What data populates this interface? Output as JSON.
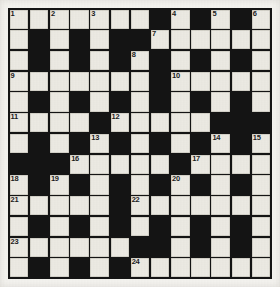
{
  "puzzle": {
    "title": "Crossword Grid",
    "type": "crossword",
    "columns": 13,
    "rows": 13,
    "colors": {
      "paper": "#f4f3ef",
      "white_cell": "#eceae3",
      "black_cell": "#141414",
      "number_text": "#1b1b1b"
    },
    "legend": {
      "white": "open letter square",
      "black": "blocked square"
    },
    "clue_numbers_present": [
      1,
      2,
      3,
      4,
      5,
      6,
      7,
      8,
      9,
      10,
      11,
      12,
      13,
      14,
      15,
      16,
      17,
      18,
      19,
      20,
      21,
      22,
      23,
      24
    ],
    "grid": [
      [
        {
          "state": "white",
          "num": "1"
        },
        {
          "state": "white",
          "num": ""
        },
        {
          "state": "white",
          "num": "2"
        },
        {
          "state": "white",
          "num": ""
        },
        {
          "state": "white",
          "num": "3"
        },
        {
          "state": "white",
          "num": ""
        },
        {
          "state": "white",
          "num": ""
        },
        {
          "state": "black",
          "num": ""
        },
        {
          "state": "white",
          "num": "4"
        },
        {
          "state": "black",
          "num": ""
        },
        {
          "state": "white",
          "num": "5"
        },
        {
          "state": "black",
          "num": ""
        },
        {
          "state": "white",
          "num": "6"
        }
      ],
      [
        {
          "state": "white",
          "num": ""
        },
        {
          "state": "black",
          "num": ""
        },
        {
          "state": "white",
          "num": ""
        },
        {
          "state": "black",
          "num": ""
        },
        {
          "state": "white",
          "num": ""
        },
        {
          "state": "black",
          "num": ""
        },
        {
          "state": "black",
          "num": ""
        },
        {
          "state": "white",
          "num": "7"
        },
        {
          "state": "white",
          "num": ""
        },
        {
          "state": "white",
          "num": ""
        },
        {
          "state": "white",
          "num": ""
        },
        {
          "state": "white",
          "num": ""
        },
        {
          "state": "white",
          "num": ""
        }
      ],
      [
        {
          "state": "white",
          "num": ""
        },
        {
          "state": "black",
          "num": ""
        },
        {
          "state": "white",
          "num": ""
        },
        {
          "state": "black",
          "num": ""
        },
        {
          "state": "white",
          "num": ""
        },
        {
          "state": "black",
          "num": ""
        },
        {
          "state": "white",
          "num": "8"
        },
        {
          "state": "black",
          "num": ""
        },
        {
          "state": "white",
          "num": ""
        },
        {
          "state": "black",
          "num": ""
        },
        {
          "state": "white",
          "num": ""
        },
        {
          "state": "black",
          "num": ""
        },
        {
          "state": "white",
          "num": ""
        }
      ],
      [
        {
          "state": "white",
          "num": "9"
        },
        {
          "state": "white",
          "num": ""
        },
        {
          "state": "white",
          "num": ""
        },
        {
          "state": "white",
          "num": ""
        },
        {
          "state": "white",
          "num": ""
        },
        {
          "state": "white",
          "num": ""
        },
        {
          "state": "white",
          "num": ""
        },
        {
          "state": "black",
          "num": ""
        },
        {
          "state": "white",
          "num": "10"
        },
        {
          "state": "white",
          "num": ""
        },
        {
          "state": "white",
          "num": ""
        },
        {
          "state": "white",
          "num": ""
        },
        {
          "state": "white",
          "num": ""
        }
      ],
      [
        {
          "state": "white",
          "num": ""
        },
        {
          "state": "black",
          "num": ""
        },
        {
          "state": "white",
          "num": ""
        },
        {
          "state": "black",
          "num": ""
        },
        {
          "state": "white",
          "num": ""
        },
        {
          "state": "black",
          "num": ""
        },
        {
          "state": "white",
          "num": ""
        },
        {
          "state": "black",
          "num": ""
        },
        {
          "state": "white",
          "num": ""
        },
        {
          "state": "black",
          "num": ""
        },
        {
          "state": "white",
          "num": ""
        },
        {
          "state": "black",
          "num": ""
        },
        {
          "state": "white",
          "num": ""
        }
      ],
      [
        {
          "state": "white",
          "num": "11"
        },
        {
          "state": "white",
          "num": ""
        },
        {
          "state": "white",
          "num": ""
        },
        {
          "state": "white",
          "num": ""
        },
        {
          "state": "black",
          "num": ""
        },
        {
          "state": "white",
          "num": "12"
        },
        {
          "state": "white",
          "num": ""
        },
        {
          "state": "white",
          "num": ""
        },
        {
          "state": "white",
          "num": ""
        },
        {
          "state": "white",
          "num": ""
        },
        {
          "state": "black",
          "num": ""
        },
        {
          "state": "black",
          "num": ""
        },
        {
          "state": "black",
          "num": ""
        }
      ],
      [
        {
          "state": "white",
          "num": ""
        },
        {
          "state": "black",
          "num": ""
        },
        {
          "state": "white",
          "num": ""
        },
        {
          "state": "black",
          "num": ""
        },
        {
          "state": "white",
          "num": "13"
        },
        {
          "state": "black",
          "num": ""
        },
        {
          "state": "white",
          "num": ""
        },
        {
          "state": "black",
          "num": ""
        },
        {
          "state": "white",
          "num": ""
        },
        {
          "state": "black",
          "num": ""
        },
        {
          "state": "white",
          "num": "14"
        },
        {
          "state": "black",
          "num": ""
        },
        {
          "state": "white",
          "num": "15"
        }
      ],
      [
        {
          "state": "black",
          "num": ""
        },
        {
          "state": "black",
          "num": ""
        },
        {
          "state": "black",
          "num": ""
        },
        {
          "state": "white",
          "num": "16"
        },
        {
          "state": "white",
          "num": ""
        },
        {
          "state": "white",
          "num": ""
        },
        {
          "state": "white",
          "num": ""
        },
        {
          "state": "white",
          "num": ""
        },
        {
          "state": "black",
          "num": ""
        },
        {
          "state": "white",
          "num": "17"
        },
        {
          "state": "white",
          "num": ""
        },
        {
          "state": "white",
          "num": ""
        },
        {
          "state": "white",
          "num": ""
        }
      ],
      [
        {
          "state": "white",
          "num": "18"
        },
        {
          "state": "black",
          "num": ""
        },
        {
          "state": "white",
          "num": "19"
        },
        {
          "state": "black",
          "num": ""
        },
        {
          "state": "white",
          "num": ""
        },
        {
          "state": "black",
          "num": ""
        },
        {
          "state": "white",
          "num": ""
        },
        {
          "state": "black",
          "num": ""
        },
        {
          "state": "white",
          "num": "20"
        },
        {
          "state": "black",
          "num": ""
        },
        {
          "state": "white",
          "num": ""
        },
        {
          "state": "black",
          "num": ""
        },
        {
          "state": "white",
          "num": ""
        }
      ],
      [
        {
          "state": "white",
          "num": "21"
        },
        {
          "state": "white",
          "num": ""
        },
        {
          "state": "white",
          "num": ""
        },
        {
          "state": "white",
          "num": ""
        },
        {
          "state": "white",
          "num": ""
        },
        {
          "state": "black",
          "num": ""
        },
        {
          "state": "white",
          "num": "22"
        },
        {
          "state": "white",
          "num": ""
        },
        {
          "state": "white",
          "num": ""
        },
        {
          "state": "white",
          "num": ""
        },
        {
          "state": "white",
          "num": ""
        },
        {
          "state": "white",
          "num": ""
        },
        {
          "state": "white",
          "num": ""
        }
      ],
      [
        {
          "state": "white",
          "num": ""
        },
        {
          "state": "black",
          "num": ""
        },
        {
          "state": "white",
          "num": ""
        },
        {
          "state": "black",
          "num": ""
        },
        {
          "state": "white",
          "num": ""
        },
        {
          "state": "black",
          "num": ""
        },
        {
          "state": "white",
          "num": ""
        },
        {
          "state": "black",
          "num": ""
        },
        {
          "state": "white",
          "num": ""
        },
        {
          "state": "black",
          "num": ""
        },
        {
          "state": "white",
          "num": ""
        },
        {
          "state": "black",
          "num": ""
        },
        {
          "state": "white",
          "num": ""
        }
      ],
      [
        {
          "state": "white",
          "num": "23"
        },
        {
          "state": "white",
          "num": ""
        },
        {
          "state": "white",
          "num": ""
        },
        {
          "state": "white",
          "num": ""
        },
        {
          "state": "white",
          "num": ""
        },
        {
          "state": "white",
          "num": ""
        },
        {
          "state": "black",
          "num": ""
        },
        {
          "state": "black",
          "num": ""
        },
        {
          "state": "white",
          "num": ""
        },
        {
          "state": "black",
          "num": ""
        },
        {
          "state": "white",
          "num": ""
        },
        {
          "state": "black",
          "num": ""
        },
        {
          "state": "white",
          "num": ""
        }
      ],
      [
        {
          "state": "white",
          "num": ""
        },
        {
          "state": "black",
          "num": ""
        },
        {
          "state": "white",
          "num": ""
        },
        {
          "state": "black",
          "num": ""
        },
        {
          "state": "white",
          "num": ""
        },
        {
          "state": "black",
          "num": ""
        },
        {
          "state": "white",
          "num": "24"
        },
        {
          "state": "white",
          "num": ""
        },
        {
          "state": "white",
          "num": ""
        },
        {
          "state": "white",
          "num": ""
        },
        {
          "state": "white",
          "num": ""
        },
        {
          "state": "white",
          "num": ""
        },
        {
          "state": "white",
          "num": ""
        }
      ]
    ]
  }
}
